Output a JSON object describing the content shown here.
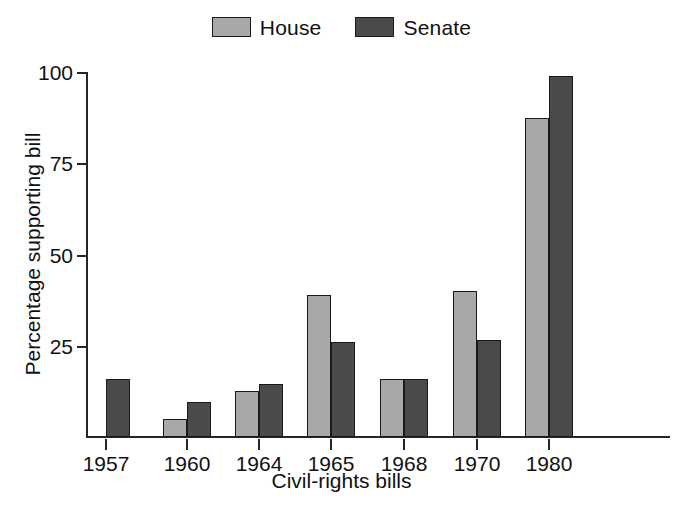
{
  "legend": {
    "position": "top-center",
    "entries": [
      {
        "label": "House",
        "color": "#a8a8a8",
        "swatch_name": "legend-swatch-house"
      },
      {
        "label": "Senate",
        "color": "#4a4a4a",
        "swatch_name": "legend-swatch-senate"
      }
    ]
  },
  "chart_data": {
    "type": "bar",
    "title": "",
    "subtitle": "",
    "xlabel": "Civil-rights bills",
    "ylabel": "Percentage supporting bill",
    "categories": [
      "1957",
      "1960",
      "1964",
      "1965",
      "1968",
      "1970",
      "1980"
    ],
    "series": [
      {
        "name": "House",
        "color": "#a8a8a8",
        "values": [
          null,
          5,
          12.5,
          39,
          16,
          40,
          87.5
        ]
      },
      {
        "name": "Senate",
        "color": "#4a4a4a",
        "values": [
          16,
          9.5,
          14.5,
          26,
          16,
          26.5,
          99
        ]
      }
    ],
    "ylim": [
      0,
      100
    ],
    "yticks": [
      25,
      50,
      75,
      100
    ],
    "ytick_labels": [
      "25",
      "50",
      "75",
      "100"
    ],
    "xtick_labels": [
      "1957",
      "1960",
      "1964",
      "1965",
      "1968",
      "1970",
      "1980"
    ],
    "grid": false,
    "legend_position": "top-center",
    "axis_color": "#262626",
    "bar_outline_color": "#1a1a1a",
    "background_color": "#ffffff"
  }
}
